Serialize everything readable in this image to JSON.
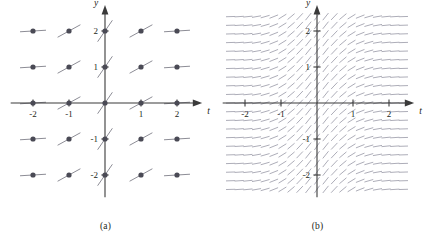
{
  "figure": {
    "panels": [
      {
        "id": "a",
        "caption": "(a)",
        "axis": {
          "xlabel": "t",
          "ylabel": "y"
        },
        "xticks": [
          "-2",
          "-1",
          "1",
          "2"
        ],
        "yticks": [
          "2",
          "1",
          "-1",
          "-2"
        ]
      },
      {
        "id": "b",
        "caption": "(b)",
        "axis": {
          "xlabel": "t",
          "ylabel": "y"
        },
        "xticks": [
          "-2",
          "-1",
          "1",
          "2"
        ],
        "yticks": [
          "2",
          "1",
          "-1",
          "-2"
        ]
      }
    ]
  },
  "chart_data": {
    "type": "scatter",
    "title": "",
    "xlabel": "t",
    "ylabel": "y",
    "xlim": [
      -2.6,
      2.6
    ],
    "ylim": [
      -2.6,
      2.6
    ],
    "grid": false,
    "legend": null,
    "panel_a": {
      "description": "Lattice of solution points with short tangent (slope) segments",
      "point_marker": "filled-circle",
      "x": [
        -2,
        -1,
        0,
        1,
        2
      ],
      "y": [
        -2,
        -1,
        0,
        1,
        2
      ],
      "slope_rule": "slope depends only on t: steepest near t=0, flattening as |t| grows",
      "slopes_by_t": [
        {
          "t": -2,
          "slope": 0.06
        },
        {
          "t": -1,
          "slope": 0.55
        },
        {
          "t": 0,
          "slope": 1.45
        },
        {
          "t": 1,
          "slope": 0.55
        },
        {
          "t": 2,
          "slope": 0.06
        }
      ],
      "points": [
        {
          "t": -2,
          "y": 2
        },
        {
          "t": -1,
          "y": 2
        },
        {
          "t": 0,
          "y": 2
        },
        {
          "t": 1,
          "y": 2
        },
        {
          "t": 2,
          "y": 2
        },
        {
          "t": -2,
          "y": 1
        },
        {
          "t": -1,
          "y": 1
        },
        {
          "t": 0,
          "y": 1
        },
        {
          "t": 1,
          "y": 1
        },
        {
          "t": 2,
          "y": 1
        },
        {
          "t": -2,
          "y": 0
        },
        {
          "t": -1,
          "y": 0
        },
        {
          "t": 0,
          "y": 0
        },
        {
          "t": 1,
          "y": 0
        },
        {
          "t": 2,
          "y": 0
        },
        {
          "t": -2,
          "y": -1
        },
        {
          "t": -1,
          "y": -1
        },
        {
          "t": 0,
          "y": -1
        },
        {
          "t": 1,
          "y": -1
        },
        {
          "t": 2,
          "y": -1
        },
        {
          "t": -2,
          "y": -2
        },
        {
          "t": -1,
          "y": -2
        },
        {
          "t": 0,
          "y": -2
        },
        {
          "t": 1,
          "y": -2
        },
        {
          "t": 2,
          "y": -2
        }
      ]
    },
    "panel_b": {
      "description": "Dense direction field of the same differential equation",
      "grid_columns": 21,
      "grid_rows": 21,
      "t_range": [
        -2.4,
        2.4
      ],
      "y_range": [
        -2.4,
        2.4
      ],
      "slope_rule": "slope depends only on t: steepest near t=0, flattening as |t| grows",
      "sample_slopes_by_t": [
        {
          "t": -2.4,
          "slope": 0.03
        },
        {
          "t": -1.8,
          "slope": 0.12
        },
        {
          "t": -1.2,
          "slope": 0.4
        },
        {
          "t": -0.6,
          "slope": 0.95
        },
        {
          "t": 0.0,
          "slope": 1.45
        },
        {
          "t": 0.6,
          "slope": 0.95
        },
        {
          "t": 1.2,
          "slope": 0.4
        },
        {
          "t": 1.8,
          "slope": 0.12
        },
        {
          "t": 2.4,
          "slope": 0.03
        }
      ]
    }
  },
  "colors": {
    "axis": "#3a3a3a",
    "point": "#4a4a55",
    "segment": "#8d8d96",
    "field": "#a9a9b4",
    "text": "#231f20"
  }
}
